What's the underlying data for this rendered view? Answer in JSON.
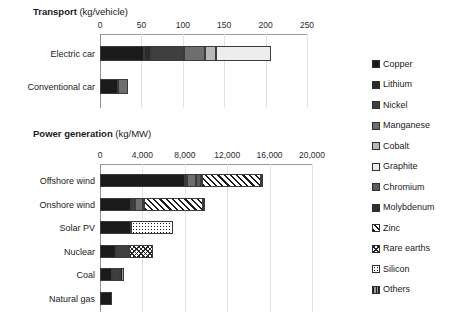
{
  "chart_data": {
    "type": "bar",
    "orientation": "horizontal",
    "stacked": true,
    "grid": true,
    "legend_position": "right",
    "legend": [
      {
        "name": "Copper",
        "pattern": "solid-near-black",
        "color": "#1b1b1b"
      },
      {
        "name": "Lithium",
        "pattern": "solid-dark",
        "color": "#2b2b2b"
      },
      {
        "name": "Nickel",
        "pattern": "solid-dark-gray",
        "color": "#3f3f3f"
      },
      {
        "name": "Manganese",
        "pattern": "solid-mid-gray",
        "color": "#6e6e6e"
      },
      {
        "name": "Cobalt",
        "pattern": "solid-light-gray",
        "color": "#b9b9b9"
      },
      {
        "name": "Graphite",
        "pattern": "solid-very-light",
        "color": "#ededed"
      },
      {
        "name": "Chromium",
        "pattern": "solid-gray",
        "color": "#5c5c5c"
      },
      {
        "name": "Molybdenum",
        "pattern": "solid-dark",
        "color": "#2f2f2f"
      },
      {
        "name": "Zinc",
        "pattern": "diagonal-hatch",
        "color": "#1c1c1c"
      },
      {
        "name": "Rare earths",
        "pattern": "cross-hatch",
        "color": "#262626"
      },
      {
        "name": "Silicon",
        "pattern": "dotted",
        "color": "#202020"
      },
      {
        "name": "Others",
        "pattern": "vertical-hatch",
        "color": "#9b9b9b"
      }
    ],
    "panels": [
      {
        "id": "transport",
        "title_bold": "Transport",
        "title_unit": "(kg/vehicle)",
        "xlabel": "",
        "ylabel": "",
        "xlim": [
          0,
          250
        ],
        "xticks": [
          0,
          50,
          100,
          150,
          200,
          250
        ],
        "xtick_labels": [
          "0",
          "50",
          "100",
          "150",
          "200",
          "250"
        ],
        "categories": [
          "Electric car",
          "Conventional car"
        ],
        "series": [
          {
            "name": "Copper",
            "values": [
              53.2,
              22.3
            ]
          },
          {
            "name": "Lithium",
            "values": [
              8.9,
              0
            ]
          },
          {
            "name": "Nickel",
            "values": [
              39.9,
              0
            ]
          },
          {
            "name": "Manganese",
            "values": [
              24.5,
              11.2
            ]
          },
          {
            "name": "Cobalt",
            "values": [
              13.3,
              0
            ]
          },
          {
            "name": "Graphite",
            "values": [
              66.5,
              0
            ]
          },
          {
            "name": "Chromium",
            "values": [
              0,
              0
            ]
          },
          {
            "name": "Molybdenum",
            "values": [
              0,
              0
            ]
          },
          {
            "name": "Zinc",
            "values": [
              0,
              0
            ]
          },
          {
            "name": "Rare earths",
            "values": [
              0,
              0
            ]
          },
          {
            "name": "Silicon",
            "values": [
              0,
              0
            ]
          },
          {
            "name": "Others",
            "values": [
              0,
              0
            ]
          }
        ],
        "totals": [
          206.3,
          33.5
        ]
      },
      {
        "id": "power",
        "title_bold": "Power generation",
        "title_unit": "(kg/MW)",
        "xlabel": "",
        "ylabel": "",
        "xlim": [
          0,
          20000
        ],
        "xticks": [
          0,
          4000,
          8000,
          12000,
          16000,
          20000
        ],
        "xtick_labels": [
          "0",
          "4,000",
          "8,000",
          "12,000",
          "16,000",
          "20,000"
        ],
        "categories": [
          "Offshore wind",
          "Onshore wind",
          "Solar PV",
          "Nuclear",
          "Coal",
          "Natural gas"
        ],
        "series": [
          {
            "name": "Copper",
            "values": [
              8000,
              2900,
              2900,
              1473,
              1150,
              1100
            ]
          },
          {
            "name": "Lithium",
            "values": [
              0,
              0,
              0,
              0,
              0,
              0
            ]
          },
          {
            "name": "Nickel",
            "values": [
              240,
              404,
              0,
              1300,
              720,
              0
            ]
          },
          {
            "name": "Manganese",
            "values": [
              790,
              780,
              0,
              0,
              0,
              0
            ]
          },
          {
            "name": "Cobalt",
            "values": [
              0,
              0,
              0,
              0,
              0,
              0
            ]
          },
          {
            "name": "Graphite",
            "values": [
              0,
              0,
              0,
              0,
              0,
              0
            ]
          },
          {
            "name": "Chromium",
            "values": [
              525,
              0,
              0,
              0,
              0,
              0
            ]
          },
          {
            "name": "Molybdenum",
            "values": [
              109,
              99,
              0,
              0,
              0,
              0
            ]
          },
          {
            "name": "Zinc",
            "values": [
              5500,
              5500,
              0,
              0,
              0,
              0
            ]
          },
          {
            "name": "Rare earths",
            "values": [
              239,
              14,
              0,
              2200,
              0,
              0
            ]
          },
          {
            "name": "Silicon",
            "values": [
              0,
              0,
              3950,
              0,
              0,
              0
            ]
          },
          {
            "name": "Others",
            "values": [
              0,
              0,
              0,
              0,
              380,
              0
            ]
          }
        ],
        "totals": [
          15403,
          9697,
          6850,
          4973,
          2250,
          1100
        ]
      }
    ]
  }
}
